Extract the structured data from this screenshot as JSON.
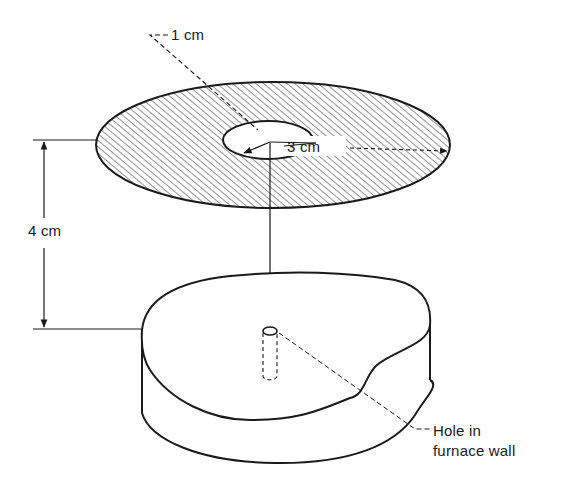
{
  "figure": {
    "type": "schematic",
    "labels": {
      "inner_radius": "1 cm",
      "outer_radius": "3 cm",
      "distance": "4 cm",
      "hole_line1": "Hole in",
      "hole_line2": "furnace wall"
    },
    "dimensions": {
      "inner_radius_cm": 1,
      "outer_radius_cm": 3,
      "separation_cm": 4
    },
    "colors": {
      "line": "#1a1a1a",
      "background": "#ffffff",
      "hatch": "#3a3a3a"
    }
  }
}
